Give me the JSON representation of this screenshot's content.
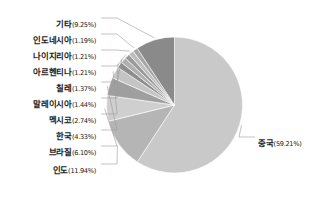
{
  "chart_data": {
    "type": "pie",
    "title": "",
    "subtitle": "",
    "xlabel": "",
    "ylabel": "",
    "legend_position": "none",
    "grid": false,
    "labels_show_percent": true,
    "start_angle_deg": 0,
    "direction": "clockwise",
    "categories": [
      "중국",
      "인도",
      "브라질",
      "한국",
      "멕시코",
      "말레이시아",
      "칠레",
      "아르헨티나",
      "나이지리아",
      "인도네시아",
      "기타"
    ],
    "values": [
      59.21,
      11.94,
      6.1,
      4.33,
      2.74,
      1.44,
      1.37,
      1.21,
      1.21,
      1.19,
      9.25
    ],
    "value_labels": [
      "(59.21%)",
      "(11.94%)",
      "(6.10%)",
      "(4.33%)",
      "(2.74%)",
      "(1.44%)",
      "(1.37%)",
      "(1.21%)",
      "(1.21%)",
      "(1.19%)",
      "(9.25%)"
    ],
    "slice_colors": [
      "#c9c9c9",
      "#b5b5b5",
      "#cfcfcf",
      "#9f9f9f",
      "#c4c4c4",
      "#8e8e8e",
      "#b0b0b0",
      "#9a9a9a",
      "#bdbdbd",
      "#a6a6a6",
      "#8a8a8a"
    ]
  },
  "slices": [
    {
      "name": "중국",
      "pct": "(59.21%)"
    },
    {
      "name": "인도",
      "pct": "(11.94%)"
    },
    {
      "name": "브라질",
      "pct": "(6.10%)"
    },
    {
      "name": "한국",
      "pct": "(4.33%)"
    },
    {
      "name": "멕시코",
      "pct": "(2.74%)"
    },
    {
      "name": "말레이시아",
      "pct": "(1.44%)"
    },
    {
      "name": "칠레",
      "pct": "(1.37%)"
    },
    {
      "name": "아르헨티나",
      "pct": "(1.21%)"
    },
    {
      "name": "나이지리아",
      "pct": "(1.21%)"
    },
    {
      "name": "인도네시아",
      "pct": "(1.19%)"
    },
    {
      "name": "기타",
      "pct": "(9.25%)"
    }
  ],
  "style": {
    "background": "#ffffff",
    "text_color": "#1a1a1a",
    "leader_color": "#9a9a9a"
  }
}
